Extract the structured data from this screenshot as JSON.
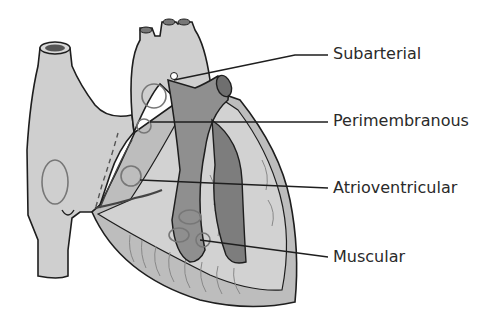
{
  "diagram": {
    "type": "anatomical-heart-septal-defects",
    "colors": {
      "outline": "#1e1e1e",
      "tissue_light": "#cfcfcf",
      "tissue_mid": "#bdbdbd",
      "pulmonary_dark": "#8f8f8f",
      "ventricle_dark": "#7d7d7d",
      "defect_ring": "#777777",
      "background": "#ffffff"
    },
    "labels": [
      {
        "text": "Subarterial",
        "x": 333,
        "y": 46
      },
      {
        "text": "Perimembranous",
        "x": 333,
        "y": 117
      },
      {
        "text": "Atrioventricular",
        "x": 333,
        "y": 182
      },
      {
        "text": "Muscular",
        "x": 333,
        "y": 252
      }
    ]
  }
}
